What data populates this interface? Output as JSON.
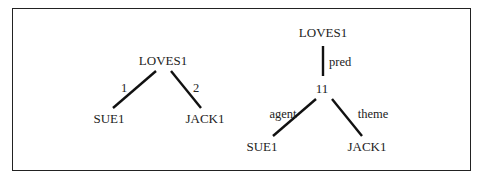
{
  "diagram": {
    "left_tree": {
      "root": "LOVES1",
      "children": [
        {
          "label": "SUE1",
          "edge_label": "1"
        },
        {
          "label": "JACK1",
          "edge_label": "2"
        }
      ]
    },
    "right_tree": {
      "root": "LOVES1",
      "root_edge_label": "pred",
      "intermediate": "11",
      "children": [
        {
          "label": "SUE1",
          "edge_label": "agent"
        },
        {
          "label": "JACK1",
          "edge_label": "theme"
        }
      ]
    }
  },
  "colors": {
    "ink": "#222222",
    "background": "#ffffff"
  }
}
